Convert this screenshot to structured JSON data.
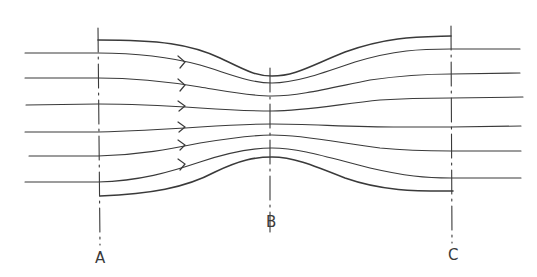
{
  "diagram": {
    "type": "venturi-streamlines",
    "stroke_color": "#3a3a3a",
    "sections": [
      {
        "id": "A",
        "label": "A",
        "x": 98
      },
      {
        "id": "B",
        "label": "B",
        "x": 270
      },
      {
        "id": "C",
        "label": "C",
        "x": 451
      }
    ],
    "streamline_count": 6,
    "arrow_count": 6,
    "flow_direction": "left-to-right"
  }
}
